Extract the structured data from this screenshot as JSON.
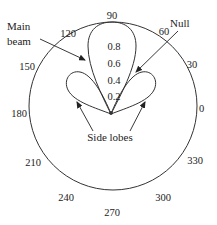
{
  "diagram": {
    "angle_labels": {
      "a0": "0",
      "a30": "30",
      "a60": "60",
      "a90": "90",
      "a120": "120",
      "a150": "150",
      "a180": "180",
      "a210": "210",
      "a240": "240",
      "a270": "270",
      "a300": "300",
      "a330": "330"
    },
    "radial_labels": {
      "r0": "0",
      "r02": "0.2",
      "r04": "0.4",
      "r06": "0.6",
      "r08": "0.8"
    },
    "annotations": {
      "main_beam_line1": "Main",
      "main_beam_line2": "beam",
      "null": "Null",
      "side_lobes": "Side lobes"
    },
    "colors": {
      "stroke": "#333333",
      "text": "#222222",
      "background": "#ffffff"
    }
  }
}
